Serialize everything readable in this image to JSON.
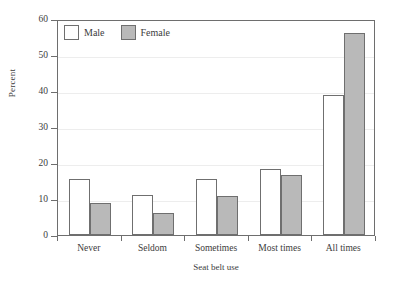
{
  "chart_data": {
    "type": "bar",
    "title": "",
    "xlabel": "Seat belt use",
    "ylabel": "Percent",
    "categories": [
      "Never",
      "Seldom",
      "Sometimes",
      "Most times",
      "All times"
    ],
    "series": [
      {
        "name": "Male",
        "values": [
          15.6,
          11.0,
          15.6,
          18.2,
          39.0
        ],
        "color": "#ffffff"
      },
      {
        "name": "Female",
        "values": [
          8.8,
          6.1,
          10.7,
          16.8,
          56.2
        ],
        "color": "#b9b9b9"
      }
    ],
    "ylim": [
      0,
      60
    ],
    "yticks": [
      0,
      10,
      20,
      30,
      40,
      50,
      60
    ],
    "ytick_labels": [
      "0",
      "10",
      "20",
      "30",
      "40",
      "50",
      "60"
    ],
    "grid": true,
    "grid_axis": "y",
    "legend_position": "top-left",
    "legend_entries": [
      "Male",
      "Female"
    ],
    "frame_color": "#6e6e6e",
    "grid_color": "#ededed",
    "bar_edge_color": "#6f6f6f"
  }
}
